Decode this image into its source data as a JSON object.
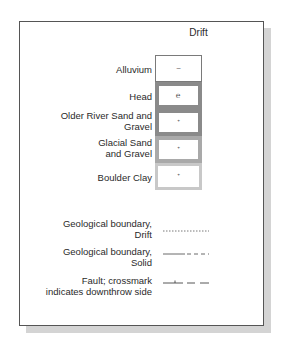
{
  "heading": "Drift",
  "units": [
    {
      "label": "Alluvium",
      "symbol": "~"
    },
    {
      "label": "Head",
      "symbol": "℮"
    },
    {
      "label": "Older River Sand and Gravel",
      "symbol": "ᐩ"
    },
    {
      "label": "Glacial Sand and Gravel",
      "symbol": "ᐩ"
    },
    {
      "label": "Boulder Clay",
      "symbol": "ᐩ"
    }
  ],
  "lines": [
    {
      "label_1": "Geological boundary,",
      "label_2": "Drift",
      "style": "dotted"
    },
    {
      "label_1": "Geological boundary,",
      "label_2": "Solid",
      "style": "solid-then-dashed"
    },
    {
      "label_1": "Fault; crossmark",
      "label_2": "indicates downthrow side",
      "style": "tick-then-dashed"
    }
  ]
}
